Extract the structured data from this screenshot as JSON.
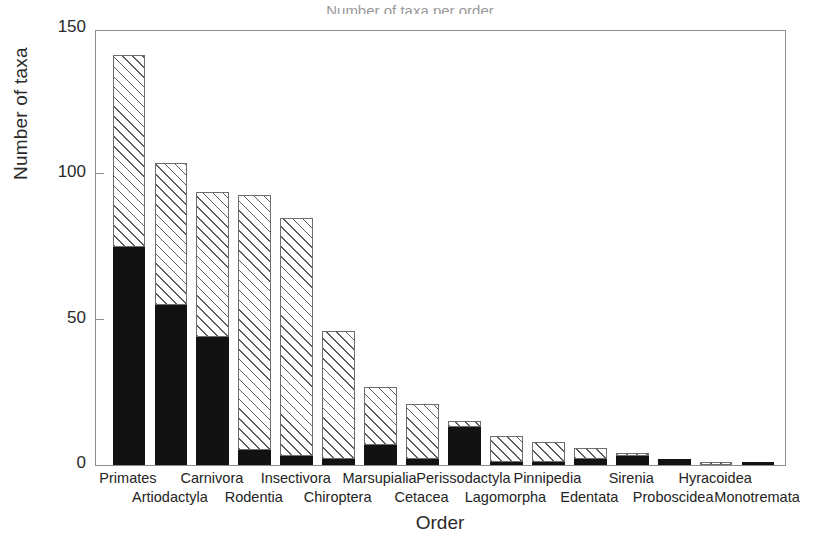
{
  "figure": {
    "clipped_top_text": "Number of taxa per order"
  },
  "axes": {
    "y_title": "Number of taxa",
    "x_title": "Order",
    "y_ticks": [
      "0",
      "50",
      "100",
      "150"
    ]
  },
  "chart_data": {
    "type": "bar",
    "title": "",
    "xlabel": "Order",
    "ylabel": "Number of taxa",
    "ylim": [
      0,
      150
    ],
    "yticks": [
      0,
      50,
      100,
      150
    ],
    "grid": false,
    "legend": "none",
    "stacked": true,
    "categories": [
      "Primates",
      "Artiodactyla",
      "Carnivora",
      "Rodentia",
      "Insectivora",
      "Chiroptera",
      "Marsupialia",
      "Cetacea",
      "Perissodactyla",
      "Lagomorpha",
      "Pinnipedia",
      "Edentata",
      "Sirenia",
      "Proboscidea",
      "Hyracoidea",
      "Monotremata"
    ],
    "series": [
      {
        "name": "solid-black-segment",
        "color": "#121212",
        "values": [
          75,
          55,
          44,
          5,
          3,
          2,
          7,
          2,
          13,
          1,
          1,
          2,
          3,
          2,
          0,
          1
        ]
      },
      {
        "name": "hatched-segment",
        "color": "#ffffff",
        "values": [
          66,
          49,
          50,
          88,
          82,
          44,
          20,
          19,
          2,
          9,
          7,
          4,
          1,
          0,
          1,
          0
        ]
      }
    ],
    "totals": [
      141,
      104,
      94,
      93,
      85,
      46,
      27,
      21,
      15,
      10,
      8,
      6,
      4,
      2,
      1,
      1
    ]
  },
  "x_label_rows": [
    0,
    1,
    0,
    1,
    0,
    1,
    0,
    1,
    0,
    1,
    0,
    1,
    0,
    1,
    0,
    1
  ]
}
